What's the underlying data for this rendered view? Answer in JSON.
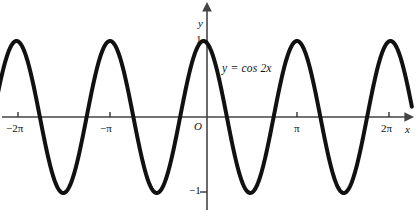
{
  "figure": {
    "title": "",
    "background_color": "#ffffff",
    "curve_color": "#111111",
    "axis_color": "#444444",
    "width": 418,
    "height": 218
  },
  "labels": {
    "y_axis_name": "y",
    "x_axis_name": "x",
    "origin": "O",
    "y_max": "1",
    "y_min": "−1",
    "equation": "y = cos 2x"
  },
  "x_ticks": [
    {
      "label": "−2π",
      "value": -6.2832,
      "px": 18
    },
    {
      "label": "−π",
      "value": -3.1416,
      "px": 110
    },
    {
      "label": "π",
      "value": 3.1416,
      "px": 297
    },
    {
      "label": "2π",
      "value": 6.2832,
      "px": 389
    }
  ],
  "y_ticks": [
    {
      "label": "1",
      "value": 1
    },
    {
      "label": "−1",
      "value": -1
    }
  ],
  "chart_data": {
    "type": "line",
    "title": "",
    "xlabel": "x",
    "ylabel": "y",
    "grid": false,
    "legend": "none",
    "annotations": [
      {
        "text": "y = cos 2x",
        "x": 0.9,
        "y": 0.72
      }
    ],
    "xlim": [
      -7.3,
      7.0
    ],
    "ylim": [
      -1.35,
      1.35
    ],
    "xticks": [
      -6.2832,
      -3.1416,
      3.1416,
      6.2832
    ],
    "xticklabels": [
      "−2π",
      "−π",
      "π",
      "2π"
    ],
    "yticks": [
      1,
      -1
    ],
    "yticklabels": [
      "1",
      "−1"
    ],
    "series": [
      {
        "name": "y = cos 2x",
        "expression": "cos(2x)",
        "amplitude": 1,
        "period": 3.14159,
        "color": "#111111",
        "linewidth": 4,
        "x": [
          -7.3,
          -7.0,
          -6.75,
          -6.5,
          -6.2832,
          -6.0,
          -5.75,
          -5.5,
          -5.25,
          -4.9,
          -4.7124,
          -4.5,
          -4.25,
          -4.0,
          -3.75,
          -3.5,
          -3.1416,
          -2.9,
          -2.65,
          -2.4,
          -2.1,
          -1.8,
          -1.5708,
          -1.35,
          -1.1,
          -0.85,
          -0.6,
          -0.35,
          0.0,
          0.35,
          0.6,
          0.85,
          1.1,
          1.35,
          1.5708,
          1.8,
          2.1,
          2.4,
          2.65,
          2.9,
          3.1416,
          3.5,
          3.75,
          4.0,
          4.25,
          4.5,
          4.7124,
          4.9,
          5.25,
          5.5,
          5.75,
          6.0,
          6.2832,
          6.5,
          6.75,
          7.0
        ],
        "y": [
          0.52,
          0.13,
          -0.4,
          -0.83,
          -1.0,
          -0.87,
          -0.46,
          0.04,
          0.52,
          0.92,
          1.0,
          0.93,
          0.58,
          0.11,
          -0.39,
          -0.81,
          -1.0,
          -0.9,
          -0.55,
          -0.06,
          0.62,
          0.96,
          1.0,
          0.78,
          0.35,
          -0.15,
          -0.62,
          -0.92,
          -1.0,
          -0.92,
          -0.62,
          -0.15,
          0.35,
          0.78,
          1.0,
          0.96,
          0.62,
          -0.06,
          -0.55,
          -0.9,
          -1.0,
          -0.81,
          -0.39,
          0.11,
          0.58,
          0.93,
          1.0,
          0.92,
          0.52,
          0.04,
          -0.46,
          -0.87,
          -1.0,
          -0.83,
          -0.4,
          0.13
        ]
      }
    ]
  }
}
